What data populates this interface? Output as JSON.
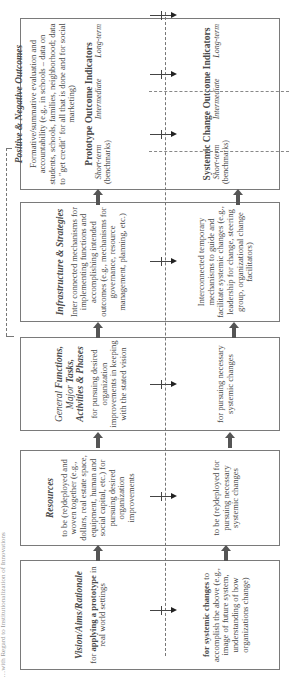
{
  "caption": "…with Regard to Institutionalization of Innovations",
  "columns": {
    "vision": {
      "title": "Vision/Aims/Rationale",
      "prototype": {
        "bold": "applying a prototype",
        "pre": "for ",
        "post": " in real world settings"
      },
      "systemic": {
        "bold": "for systemic changes",
        "post": " to accomplish the above (e.g., image of future system, understanding of how organizations change)"
      }
    },
    "resources": {
      "title": "Resources",
      "prototype": "to be (re)deployed and woven together (e.g., dollars, real estate space, equipment, human and social capital, etc.) for pursuing desired organization improvements",
      "systemic": "to be (re)deployed for pursuing necessary systemic changes"
    },
    "functions": {
      "title_parts": [
        "General ",
        "Functions,",
        " Major ",
        "Tasks,",
        " ",
        "Activities & Phases"
      ],
      "prototype": "for pursuing desired organization improvements in keeping with the stated vision",
      "systemic": "for pursuing necessary systemic changes"
    },
    "infrastructure": {
      "title": "Infrastructure & Strategies",
      "prototype": "Inter connected mechanisms for implementing functions and accomplishing intended outcomes (e.g., mechanisms for governance, resource management, planning, etc.)",
      "systemic": "Interconnected temporary mechanisms to guide and facilitate systemic changes (e.g., leadership for change, steering group, organizational change facilitators)"
    },
    "outcomes": {
      "title": "Positive & Negative Outcomes",
      "description": "Formative/summative evaluation and accountability (e.g., in schools – data on students, schools, families, neighborhood; data to \"get credit\" for all that is done and for social marketing)",
      "prototype_indicators": {
        "title": "Prototype Outcome Indicators",
        "short": "Short-term",
        "short_note": "(benchmarks)",
        "intermediate": "Intermediate",
        "long": "Long-term"
      },
      "systemic_indicators": {
        "title": "Systemic Change Outcome Indicators",
        "short": "Short-term",
        "short_note": "(benchmarks)",
        "intermediate": "Intermediate",
        "long": "Long-term"
      }
    }
  },
  "colors": {
    "arrow": "#555555",
    "border": "#7a7a7a",
    "text": "#4a4a4a"
  }
}
